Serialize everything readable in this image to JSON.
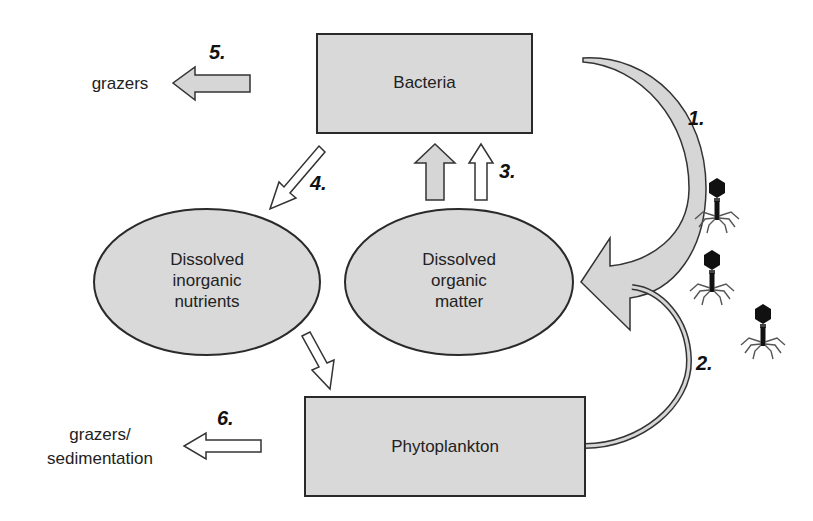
{
  "diagram": {
    "type": "microbial-loop-flow",
    "colors": {
      "node_fill": "#d9d9d9",
      "stroke": "#2a2a2a",
      "arrow_fill_gray": "#d6d6d6",
      "arrow_fill_white": "#ffffff",
      "phage": "#111111"
    },
    "nodes": {
      "bacteria": {
        "label": "Bacteria",
        "shape": "rectangle"
      },
      "inorganic": {
        "label_lines": [
          "Dissolved",
          "inorganic",
          "nutrients"
        ],
        "shape": "ellipse"
      },
      "organic": {
        "label_lines": [
          "Dissolved",
          "organic",
          "matter"
        ],
        "shape": "ellipse"
      },
      "phytoplankton": {
        "label": "Phytoplankton",
        "shape": "rectangle"
      }
    },
    "external": {
      "grazers": "grazers",
      "grazers_sed_lines": [
        "grazers/",
        "sedimentation"
      ]
    },
    "flows": [
      {
        "number": "1.",
        "from": "Bacteria",
        "to": "Dissolved organic matter",
        "style": "large curved gray arrow (viral lysis)"
      },
      {
        "number": "2.",
        "from": "Phytoplankton",
        "to": "Dissolved organic matter",
        "style": "thin curved double-line arrow"
      },
      {
        "number": "3.",
        "from": "Dissolved organic matter",
        "to": "Bacteria",
        "style": "gray and white upward arrows"
      },
      {
        "number": "4.",
        "from": "Bacteria",
        "to": "Dissolved inorganic nutrients",
        "style": "white diagonal arrow"
      },
      {
        "number": "",
        "from": "Dissolved inorganic nutrients",
        "to": "Phytoplankton",
        "style": "white diagonal arrow"
      },
      {
        "number": "5.",
        "from": "Bacteria",
        "to": "grazers",
        "style": "gray left arrow"
      },
      {
        "number": "6.",
        "from": "Phytoplankton",
        "to": "grazers/sedimentation",
        "style": "white left arrow"
      }
    ],
    "phage_icons": 3
  }
}
